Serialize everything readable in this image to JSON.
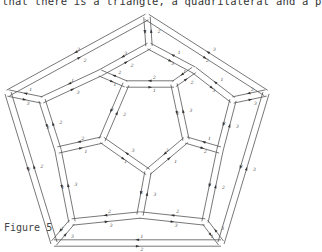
{
  "document": {
    "top_text": "that there is a triangle, a quadrilateral and a p",
    "figure_caption": "Figure 5"
  },
  "figure": {
    "type": "dodecahedron-schlegel-diagram-double-edged",
    "outer_pentagon": [
      [
        147,
        17
      ],
      [
        266,
        93
      ],
      [
        221,
        243
      ],
      [
        54,
        243
      ],
      [
        8,
        93
      ]
    ],
    "decagon": [
      [
        149,
        46
      ],
      [
        194,
        70
      ],
      [
        233,
        100
      ],
      [
        220,
        150
      ],
      [
        205,
        222
      ],
      [
        140,
        215
      ],
      [
        72,
        222
      ],
      [
        58,
        150
      ],
      [
        42,
        100
      ],
      [
        100,
        73
      ]
    ],
    "inner_pentagon": [
      [
        126,
        84
      ],
      [
        174,
        84
      ],
      [
        186,
        140
      ],
      [
        148,
        172
      ],
      [
        102,
        140
      ]
    ],
    "edge_labels": [
      "1",
      "2",
      "3"
    ],
    "line_color": "#555555"
  }
}
